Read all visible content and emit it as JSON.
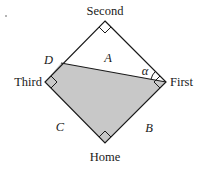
{
  "diagram": {
    "colors": {
      "stroke": "#1a1a1a",
      "shaded": "#c8c8c8",
      "background": "#ffffff"
    },
    "bases": {
      "second": "Second",
      "third": "Third",
      "first": "First",
      "home": "Home"
    },
    "points": {
      "d": "D"
    },
    "regions": {
      "a": "A",
      "b": "B",
      "c": "C"
    },
    "angle": {
      "alpha": "α"
    }
  }
}
